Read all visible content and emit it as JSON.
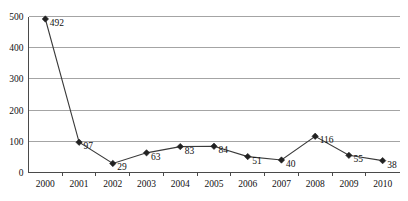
{
  "chart_data": {
    "type": "line",
    "title": "",
    "subtitle": "",
    "xlabel": "",
    "ylabel": "",
    "categories": [
      "2000",
      "2001",
      "2002",
      "2003",
      "2004",
      "2005",
      "2006",
      "2007",
      "2008",
      "2009",
      "2010"
    ],
    "values": [
      492,
      97,
      29,
      63,
      83,
      84,
      51,
      40,
      116,
      55,
      38
    ],
    "point_labels": [
      "492",
      "97",
      "29",
      "63",
      "83",
      "84",
      "51",
      "40",
      "116",
      "55",
      "38"
    ],
    "series": [
      {
        "name": "",
        "values": [
          492,
          97,
          29,
          63,
          83,
          84,
          51,
          40,
          116,
          55,
          38
        ]
      }
    ],
    "ylim": [
      0,
      500
    ],
    "y_ticks": [
      0,
      100,
      200,
      300,
      400,
      500
    ],
    "y_tick_labels": [
      "0",
      "100",
      "200",
      "300",
      "400",
      "500"
    ],
    "grid": true,
    "grid_axis": "y",
    "legend": false,
    "legend_position": "none",
    "marker": "diamond",
    "colors": {
      "line": "#3a3a3a",
      "marker": "#222222",
      "gridline": "#9a9a9a",
      "axis": "#4a4a4a",
      "text": "#111111",
      "background": "#ffffff"
    }
  }
}
